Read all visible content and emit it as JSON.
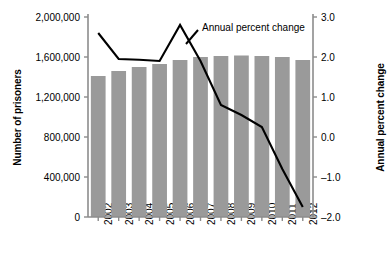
{
  "chart_data": {
    "type": "bar",
    "title": "",
    "categories": [
      "2002",
      "2003",
      "2004",
      "2005",
      "2006",
      "2007",
      "2008",
      "2009",
      "2010",
      "2011",
      "2012"
    ],
    "series": [
      {
        "name": "Number of prisoners",
        "type": "bar",
        "axis": "left",
        "color": "#9a9a9a",
        "values": [
          1410000,
          1460000,
          1500000,
          1530000,
          1570000,
          1600000,
          1610000,
          1615000,
          1610000,
          1600000,
          1570000
        ]
      },
      {
        "name": "Annual percent change",
        "type": "line",
        "axis": "right",
        "color": "#000000",
        "values": [
          2.6,
          1.95,
          1.93,
          1.9,
          2.8,
          1.9,
          0.8,
          0.55,
          0.25,
          -0.8,
          -1.75
        ]
      }
    ],
    "xlabel": "",
    "ylabel": "Number of prisoners",
    "y2label": "Annual percent change",
    "ylim": [
      0,
      2000000
    ],
    "yticks": [
      0,
      400000,
      800000,
      1200000,
      1600000,
      2000000
    ],
    "ytick_labels": [
      "0",
      "400,000",
      "800,000",
      "1,200,000",
      "1,600,000",
      "2,000,000"
    ],
    "y2lim": [
      -2.0,
      3.0
    ],
    "y2ticks": [
      -2.0,
      -1.0,
      0.0,
      1.0,
      2.0,
      3.0
    ],
    "y2tick_labels": [
      "–2.0",
      "–1.0",
      "0.0",
      "1.0",
      "2.0",
      "3.0"
    ],
    "grid": false,
    "legend": {
      "position": "top-right-inline",
      "entries": [
        "Annual percent change"
      ]
    },
    "annotations": [
      {
        "text": "Annual percent change",
        "kind": "series-callout",
        "target_series": "Annual percent change"
      }
    ]
  },
  "axes": {
    "left_title": "Number of prisoners",
    "right_title": "Annual percent change"
  },
  "legend": {
    "line_label": "Annual percent change"
  },
  "colors": {
    "bar_fill": "#9a9a9a",
    "line_stroke": "#000000",
    "axis_stroke": "#8c8c8c",
    "text": "#000000",
    "background": "#ffffff"
  }
}
